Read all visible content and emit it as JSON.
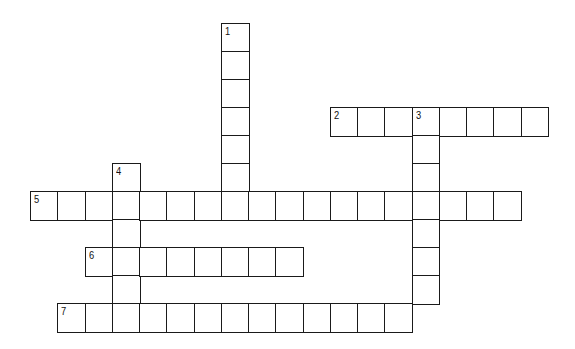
{
  "puzzle": {
    "type": "crossword",
    "grid": {
      "origin_x": 30,
      "origin_y": 23,
      "cell_w": 27.25,
      "cell_h": 28,
      "border_color": "#1a1a1a",
      "fill_color": "#ffffff"
    },
    "entries": [
      {
        "number": "1",
        "direction": "down",
        "row": 0,
        "col": 7,
        "length": 7
      },
      {
        "number": "2",
        "direction": "across",
        "row": 3,
        "col": 11,
        "length": 8
      },
      {
        "number": "3",
        "direction": "down",
        "row": 3,
        "col": 14,
        "length": 7
      },
      {
        "number": "4",
        "direction": "down",
        "row": 5,
        "col": 3,
        "length": 6
      },
      {
        "number": "5",
        "direction": "across",
        "row": 6,
        "col": 0,
        "length": 18
      },
      {
        "number": "6",
        "direction": "across",
        "row": 8,
        "col": 2,
        "length": 8
      },
      {
        "number": "7",
        "direction": "across",
        "row": 10,
        "col": 1,
        "length": 13
      }
    ]
  }
}
